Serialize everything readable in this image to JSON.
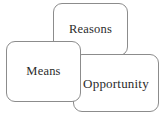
{
  "diagram": {
    "background_color": "#ffffff",
    "border_color": "#8c8c8c",
    "text_color": "#2b2b2b",
    "nodes": [
      {
        "id": "reasons",
        "label": "Reasons",
        "position": "top-center",
        "z_order": 1
      },
      {
        "id": "opportunity",
        "label": "Opportunity",
        "position": "bottom-right",
        "z_order": 2
      },
      {
        "id": "means",
        "label": "Means",
        "position": "middle-left",
        "z_order": 3
      }
    ]
  }
}
